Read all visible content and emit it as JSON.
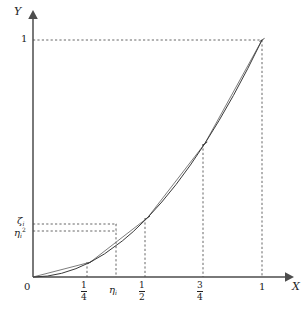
{
  "figure": {
    "title": "",
    "axes": {
      "x_axis_label": "X",
      "y_axis_label": "Y",
      "origin_label": "0"
    },
    "x_ticks": [
      {
        "id": "quarter",
        "label_num": "1",
        "label_den": "4",
        "kind": "fraction",
        "value": 0.25
      },
      {
        "id": "eta-i",
        "label": "η",
        "subscript": "i",
        "kind": "symbol",
        "value": 0.39
      },
      {
        "id": "half",
        "label_num": "1",
        "label_den": "2",
        "kind": "fraction",
        "value": 0.5
      },
      {
        "id": "three-quarters",
        "label_num": "3",
        "label_den": "4",
        "kind": "fraction",
        "value": 0.75
      },
      {
        "id": "one",
        "label": "1",
        "kind": "plain",
        "value": 1.0
      }
    ],
    "y_ticks": [
      {
        "id": "one",
        "label": "1",
        "kind": "plain",
        "value": 1.0
      },
      {
        "id": "zeta-i",
        "label": "ζ",
        "subscript": "i",
        "kind": "symbol",
        "value": 0.165
      },
      {
        "id": "eta-i-squared",
        "label": "η",
        "subscript": "i",
        "superscript": "2",
        "kind": "symbol",
        "value": 0.152
      }
    ],
    "colors": {
      "axis": "#4d4d4d",
      "curve": "#3a3a3a",
      "chord": "#6e6e6e",
      "dashed": "#555555",
      "text": "#222222",
      "background": "#ffffff"
    }
  },
  "chart_data": {
    "type": "line",
    "title": "",
    "xlabel": "X",
    "ylabel": "Y",
    "xlim": [
      0,
      1
    ],
    "ylim": [
      0,
      1
    ],
    "grid": false,
    "legend": "none",
    "series": [
      {
        "name": "curve y = x^2",
        "kind": "smooth-curve",
        "x": [
          0,
          0.0625,
          0.125,
          0.1875,
          0.25,
          0.3125,
          0.39,
          0.4375,
          0.5,
          0.5625,
          0.625,
          0.6875,
          0.75,
          0.8125,
          0.875,
          0.9375,
          1
        ],
        "values": [
          0,
          0.0039,
          0.0156,
          0.0352,
          0.0625,
          0.0977,
          0.1521,
          0.1914,
          0.25,
          0.3164,
          0.3906,
          0.4727,
          0.5625,
          0.6602,
          0.7656,
          0.8789,
          1
        ]
      },
      {
        "name": "inscribed polygon (chords)",
        "kind": "piecewise-linear",
        "x": [
          0,
          0.25,
          0.5,
          0.75,
          1
        ],
        "values": [
          0,
          0.0625,
          0.25,
          0.5625,
          1
        ]
      }
    ],
    "annotations": [
      {
        "id": "eta-i-vertical",
        "type": "vline",
        "x": 0.39,
        "label": "η_i"
      },
      {
        "id": "zeta-i-horizontal",
        "type": "hline",
        "y": 0.165,
        "label": "ζ_i"
      },
      {
        "id": "eta-i-squared-horizontal",
        "type": "hline",
        "y": 0.152,
        "label": "η_i^2"
      },
      {
        "id": "unit-corner",
        "type": "point",
        "x": 1,
        "y": 1,
        "label": "(1,1)"
      }
    ],
    "dashed_verticals": [
      0.25,
      0.39,
      0.5,
      0.75,
      1.0
    ],
    "dashed_horizontals": [
      1.0,
      0.165,
      0.152
    ]
  }
}
